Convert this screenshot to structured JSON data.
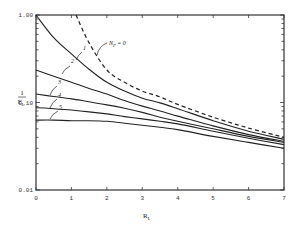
{
  "chart_data": {
    "type": "line",
    "title": "",
    "xlabel": "R_L",
    "ylabel": "1/F_L",
    "xlim": [
      0,
      7
    ],
    "ylim": [
      0.01,
      1.0
    ],
    "yscale": "log",
    "grid": false,
    "legend": "inline curve labels",
    "x_ticks": [
      "0",
      "1",
      "2",
      "3",
      "4",
      "5",
      "6",
      "7"
    ],
    "y_ticks": [
      "1.00",
      "0.10",
      "0.01"
    ],
    "series": [
      {
        "name": "N_P = 0",
        "style": "dashed",
        "x": [
          1.13,
          1.5,
          2.0,
          2.5,
          3.0,
          3.5,
          4.0,
          5.0,
          6.0,
          7.0
        ],
        "values": [
          1.0,
          0.48,
          0.235,
          0.17,
          0.135,
          0.116,
          0.095,
          0.068,
          0.051,
          0.04
        ]
      },
      {
        "name": "1",
        "style": "solid",
        "x": [
          0,
          0.5,
          1.0,
          1.5,
          2.0,
          2.5,
          3.0,
          3.5,
          4.0,
          5.0,
          6.0,
          7.0
        ],
        "values": [
          1.0,
          0.55,
          0.36,
          0.24,
          0.17,
          0.135,
          0.112,
          0.099,
          0.085,
          0.062,
          0.047,
          0.038
        ]
      },
      {
        "name": "2",
        "style": "solid",
        "x": [
          0,
          0.5,
          1.0,
          1.5,
          2.0,
          2.5,
          3.0,
          3.5,
          4.0,
          5.0,
          6.0,
          7.0
        ],
        "values": [
          0.235,
          0.2,
          0.17,
          0.145,
          0.125,
          0.105,
          0.091,
          0.08,
          0.07,
          0.054,
          0.043,
          0.036
        ]
      },
      {
        "name": "3",
        "style": "solid",
        "x": [
          0,
          0.5,
          1.0,
          1.5,
          2.0,
          2.5,
          3.0,
          3.5,
          4.0,
          5.0,
          6.0,
          7.0
        ],
        "values": [
          0.125,
          0.117,
          0.11,
          0.102,
          0.094,
          0.086,
          0.077,
          0.068,
          0.061,
          0.05,
          0.041,
          0.035
        ]
      },
      {
        "name": "4",
        "style": "solid",
        "x": [
          0,
          0.5,
          1.0,
          1.5,
          2.0,
          2.5,
          3.0,
          3.5,
          4.0,
          5.0,
          6.0,
          7.0
        ],
        "values": [
          0.087,
          0.085,
          0.082,
          0.078,
          0.074,
          0.069,
          0.065,
          0.061,
          0.057,
          0.047,
          0.039,
          0.033
        ]
      },
      {
        "name": "5",
        "style": "solid",
        "x": [
          0,
          0.5,
          1.0,
          1.5,
          2.0,
          2.5,
          3.0,
          3.5,
          4.0,
          5.0,
          6.0,
          7.0
        ],
        "values": [
          0.063,
          0.063,
          0.062,
          0.062,
          0.061,
          0.058,
          0.055,
          0.052,
          0.049,
          0.041,
          0.035,
          0.03
        ]
      }
    ],
    "annotations": [
      "N_P = 0",
      "1",
      "2",
      "3",
      "4",
      "5"
    ]
  },
  "labels": {
    "y_label_num": "1",
    "y_label_den": "F",
    "y_label_sub": "L",
    "x_label": "R",
    "x_label_sub": "L",
    "np_label": "N",
    "np_sub": "P",
    "np_eq": "= 0"
  }
}
